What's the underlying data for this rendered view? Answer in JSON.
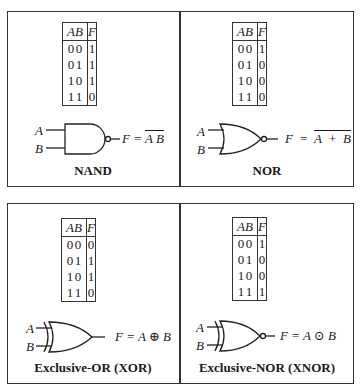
{
  "gates": [
    {
      "name": "NAND",
      "label": "NAND",
      "headers": [
        "A",
        "B",
        "F"
      ],
      "rows": [
        [
          "0",
          "0",
          "1"
        ],
        [
          "0",
          "1",
          "1"
        ],
        [
          "1",
          "0",
          "1"
        ],
        [
          "1",
          "1",
          "0"
        ]
      ],
      "input_a": "A",
      "input_b": "B",
      "eq_prefix": "F = ",
      "eq_expr": "A B",
      "eq_overline": true
    },
    {
      "name": "NOR",
      "label": "NOR",
      "headers": [
        "A",
        "B",
        "F"
      ],
      "rows": [
        [
          "0",
          "0",
          "1"
        ],
        [
          "0",
          "1",
          "0"
        ],
        [
          "1",
          "0",
          "0"
        ],
        [
          "1",
          "1",
          "0"
        ]
      ],
      "input_a": "A",
      "input_b": "B",
      "eq_prefix": "F = ",
      "eq_expr": "A + B",
      "eq_overline": true
    },
    {
      "name": "XOR",
      "label": "Exclusive-OR (XOR)",
      "headers": [
        "A",
        "B",
        "F"
      ],
      "rows": [
        [
          "0",
          "0",
          "0"
        ],
        [
          "0",
          "1",
          "1"
        ],
        [
          "1",
          "0",
          "1"
        ],
        [
          "1",
          "1",
          "0"
        ]
      ],
      "input_a": "A",
      "input_b": "B",
      "eq_prefix": "F = ",
      "eq_expr": "A ⊕ B",
      "eq_overline": false
    },
    {
      "name": "XNOR",
      "label": "Exclusive-NOR (XNOR)",
      "headers": [
        "A",
        "B",
        "F"
      ],
      "rows": [
        [
          "0",
          "0",
          "1"
        ],
        [
          "0",
          "1",
          "0"
        ],
        [
          "1",
          "0",
          "0"
        ],
        [
          "1",
          "1",
          "1"
        ]
      ],
      "input_a": "A",
      "input_b": "B",
      "eq_prefix": "F = ",
      "eq_expr": "A ⊙ B",
      "eq_overline": false
    }
  ]
}
